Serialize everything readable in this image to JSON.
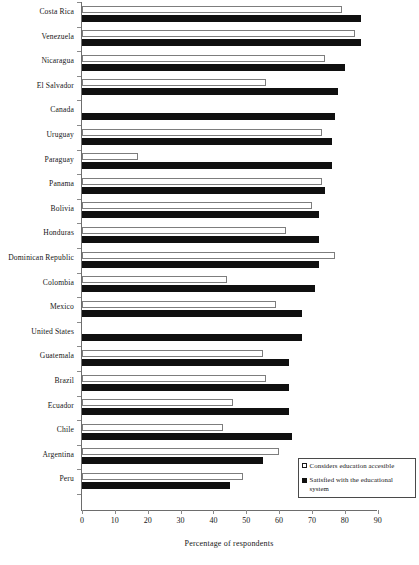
{
  "chart_data": {
    "type": "bar",
    "orientation": "horizontal",
    "title": "",
    "xlabel": "Percentage of respondents",
    "ylabel": "",
    "xlim": [
      0,
      95
    ],
    "xticks": [
      0,
      10,
      20,
      30,
      40,
      50,
      60,
      70,
      80,
      90
    ],
    "grid": false,
    "legend_position": "bottom-right",
    "categories": [
      "Costa Rica",
      "Venezuela",
      "Nicaragua",
      "El Salvador",
      "Canada",
      "Uruguay",
      "Paraguay",
      "Panama",
      "Bolivia",
      "Honduras",
      "Dominican Republic",
      "Colombia",
      "Mexico",
      "United States",
      "Guatemala",
      "Brazil",
      "Ecuador",
      "Chile",
      "Argentina",
      "Peru"
    ],
    "series": [
      {
        "name": "Considers education accesible",
        "style": "open",
        "values": [
          79,
          83,
          74,
          56,
          null,
          73,
          17,
          73,
          70,
          62,
          77,
          44,
          59,
          null,
          55,
          56,
          46,
          43,
          60,
          49
        ]
      },
      {
        "name": "Satisfied with the educational system",
        "style": "filled",
        "values": [
          85,
          85,
          80,
          78,
          77,
          76,
          76,
          74,
          72,
          72,
          72,
          71,
          67,
          67,
          63,
          63,
          63,
          64,
          55,
          45
        ]
      }
    ]
  },
  "legend": {
    "items": [
      {
        "label": "Considers education accesible",
        "swatch": "open-square-icon"
      },
      {
        "label": "Satisfied with the educational system",
        "swatch": "filled-square-icon"
      }
    ]
  },
  "axis": {
    "x_title": "Percentage of respondents",
    "tick_labels": [
      "0",
      "10",
      "20",
      "30",
      "40",
      "50",
      "60",
      "70",
      "80",
      "90"
    ]
  },
  "colors": {
    "bar_filled": "#101010",
    "bar_open_fill": "#ffffff",
    "bar_open_stroke": "#7d7d7d",
    "axis": "#6d6d6d",
    "text": "#161616",
    "background": "#ffffff"
  }
}
